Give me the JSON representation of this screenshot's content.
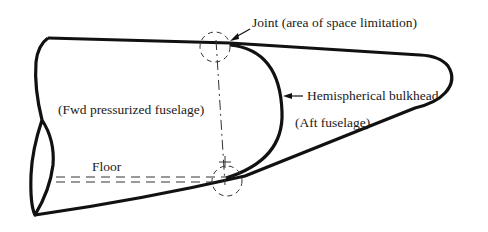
{
  "diagram": {
    "labels": {
      "joint": "Joint (area of space limitation)",
      "bulkhead": "Hemispherical bulkhead",
      "fwd": "(Fwd pressurized fuselage)",
      "aft": "(Aft fuselage)",
      "floor": "Floor"
    },
    "colors": {
      "ink": "#111111",
      "background": "#ffffff"
    }
  }
}
